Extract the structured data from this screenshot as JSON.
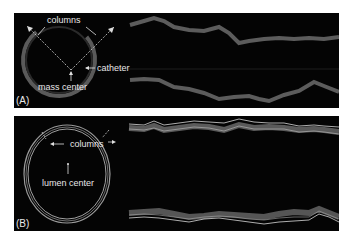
{
  "figure": {
    "panels": [
      {
        "id": "A",
        "label": "(A)",
        "annotations": {
          "columns": "columns",
          "catheter": "catheter",
          "center": "mass center"
        }
      },
      {
        "id": "B",
        "label": "(B)",
        "annotations": {
          "columns": "columns",
          "center": "lumen center"
        }
      }
    ]
  },
  "colors": {
    "background": "#040404",
    "annotation_text": "#e8e8e8",
    "page": "#ffffff"
  }
}
